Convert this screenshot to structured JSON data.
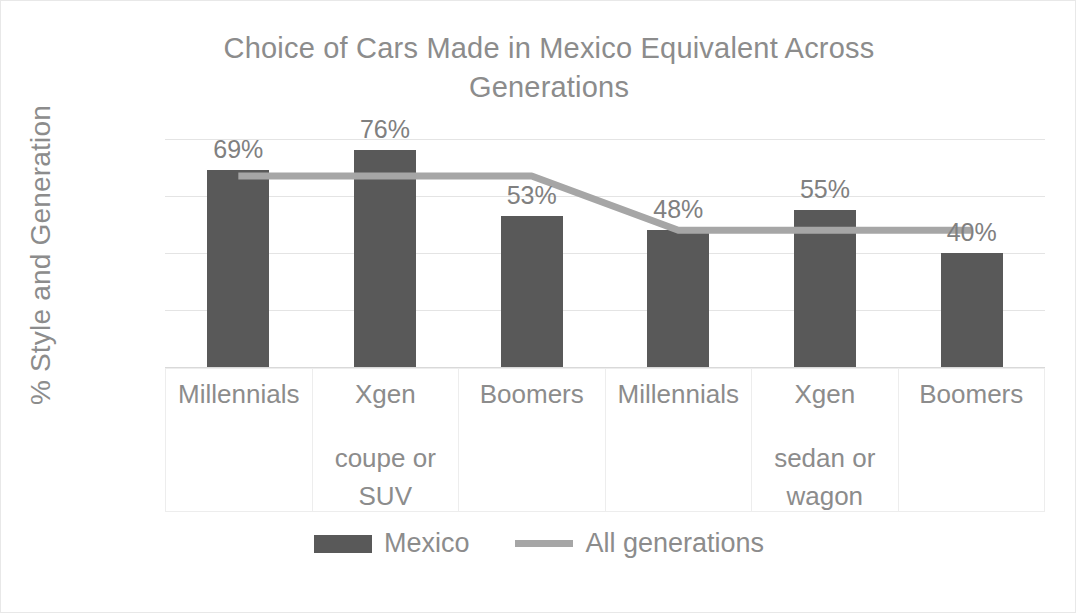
{
  "chart_data": {
    "type": "bar",
    "title": "Choice of Cars Made in Mexico Equivalent Across Generations",
    "title_line1": "Choice of Cars Made in Mexico Equivalent Across",
    "title_line2": "Generations",
    "xlabel": "",
    "ylabel": "% Style and Generation",
    "ylim": [
      0,
      80
    ],
    "grid": true,
    "legend_position": "bottom",
    "categories": [
      "Millennials",
      "Xgen",
      "Boomers",
      "Millennials",
      "Xgen",
      "Boomers"
    ],
    "category_groups": [
      {
        "label": "coupe or SUV",
        "label_line1": "coupe or",
        "label_line2": "SUV",
        "span_start": 0,
        "span_end": 2,
        "center_index": 1
      },
      {
        "label": "sedan or wagon",
        "label_line1": "sedan or",
        "label_line2": "wagon",
        "span_start": 3,
        "span_end": 5,
        "center_index": 4
      }
    ],
    "ytick_labels": [
      "80%",
      "60%",
      "40%",
      "20%",
      "0%"
    ],
    "ytick_values": [
      80,
      60,
      40,
      20,
      0
    ],
    "series": [
      {
        "name": "Mexico",
        "type": "bar",
        "color": "#595959",
        "values": [
          69,
          76,
          53,
          48,
          55,
          40
        ],
        "data_labels": [
          "69%",
          "76%",
          "53%",
          "48%",
          "55%",
          "40%"
        ]
      },
      {
        "name": "All generations",
        "type": "line",
        "color": "#a6a6a6",
        "values": [
          67,
          67,
          67,
          48,
          48,
          48
        ]
      }
    ]
  },
  "legend": {
    "items": [
      {
        "label": "Mexico",
        "marker": "bar-swatch",
        "color": "#595959"
      },
      {
        "label": "All generations",
        "marker": "line-swatch",
        "color": "#a6a6a6"
      }
    ]
  },
  "colors": {
    "bar": "#595959",
    "line": "#a6a6a6",
    "text": "#8c8c8c",
    "gridline": "#e4e4e4",
    "border": "#ededed",
    "background": "#ffffff"
  }
}
